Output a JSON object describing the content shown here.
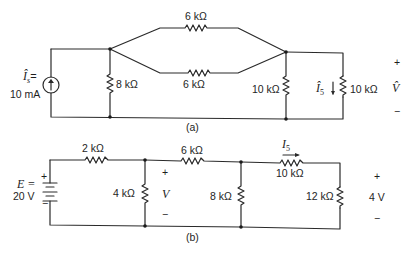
{
  "circuit_a": {
    "caption": "(a)",
    "source": {
      "symbol": "Î",
      "subscript": "s",
      "eq": "=",
      "value": "10 mA"
    },
    "resistors": {
      "r_shunt_left": "8 kΩ",
      "r_top": "6 kΩ",
      "r_bottom": "6 kΩ",
      "r_shunt_mid": "10 kΩ",
      "r_load": "10 kΩ"
    },
    "current": {
      "symbol": "Î",
      "subscript": "5"
    },
    "output": {
      "plus": "+",
      "symbol": "V̂",
      "minus": "−"
    }
  },
  "circuit_b": {
    "caption": "(b)",
    "source": {
      "label": "E =",
      "value": "20 V",
      "plus": "+",
      "minus": "−"
    },
    "resistors": {
      "r_series1": "2 kΩ",
      "r_shunt1": "4 kΩ",
      "r_series2": "6 kΩ",
      "r_shunt2": "8 kΩ",
      "r_series3": "10 kΩ",
      "r_load": "12 kΩ"
    },
    "node_voltage": {
      "plus": "+",
      "symbol": "V",
      "minus": "−"
    },
    "current": {
      "symbol": "I",
      "subscript": "5"
    },
    "output": {
      "plus": "+",
      "value": "4 V",
      "minus": "−"
    }
  }
}
